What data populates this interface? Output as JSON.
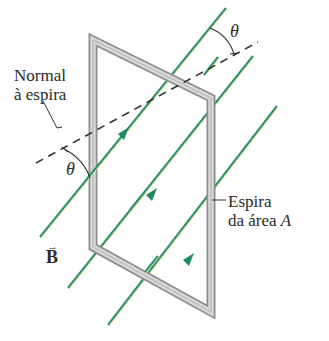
{
  "diagram": {
    "labels": {
      "normal_line1": "Normal",
      "normal_line2": "à espira",
      "theta_top": "θ",
      "theta_bottom": "θ",
      "loop_line1": "Espira",
      "loop_line2_prefix": "da área ",
      "loop_line2_var": "A",
      "field_symbol": "B",
      "field_arrow": "→"
    },
    "colors": {
      "field_line": "#2f8f7a",
      "field_line_highlight": "#d8e86a",
      "arrowhead": "#1f8a60",
      "loop_outer": "#9a9a9a",
      "loop_inner": "#d6d6d6",
      "dashed_normal": "#333333",
      "text": "#2a2a2a"
    },
    "loop": {
      "corners": [
        [
          93,
          40
        ],
        [
          211,
          98
        ],
        [
          211,
          312
        ],
        [
          93,
          247
        ]
      ],
      "bar_width": 8
    },
    "field_lines": [
      {
        "from": [
          40,
          237
        ],
        "to": [
          226,
          8
        ],
        "arrow_at": [
          124,
          133
        ]
      },
      {
        "from": [
          68,
          288
        ],
        "to": [
          253,
          56
        ],
        "arrow_at": [
          152,
          194
        ]
      },
      {
        "from": [
          108,
          325
        ],
        "to": [
          277,
          106
        ],
        "arrow_at": [
          189,
          259
        ]
      }
    ],
    "normal_line": {
      "from": [
        36,
        163
      ],
      "to": [
        258,
        42
      ]
    }
  }
}
